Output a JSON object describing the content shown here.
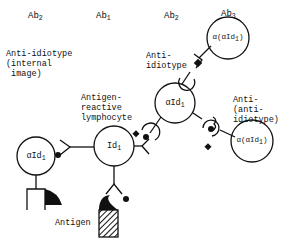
{
  "headers": {
    "ab2_left": {
      "base": "Ab",
      "sub": "2"
    },
    "ab1": {
      "base": "Ab",
      "sub": "1"
    },
    "ab2_mid": {
      "base": "Ab",
      "sub": "2"
    },
    "ab3": {
      "base": "Ab",
      "sub": "3"
    }
  },
  "labels": {
    "anti_idiotype_internal": "Anti-idiotype\n(internal\n image)",
    "antigen_reactive": "Antigen-\nreactive\nlymphocyte",
    "anti_idiotype": "Anti-\nidiotype",
    "anti_anti_idiotype": "Anti-\n(anti-\nidiotype)",
    "antigen": "Antigen"
  },
  "cells": {
    "left_alpha_id": {
      "base": "αId",
      "sub": "1"
    },
    "center_id": {
      "base": "Id",
      "sub": "1"
    },
    "mid_alpha_id": {
      "base": "αId",
      "sub": "1"
    },
    "top_right": {
      "base": "α(αId",
      "sub": "1",
      "suffix": ")"
    },
    "bottom_right": {
      "base": "α(αId",
      "sub": "1",
      "suffix": ")"
    }
  },
  "colors": {
    "ink": "#111111",
    "background": "#ffffff"
  }
}
